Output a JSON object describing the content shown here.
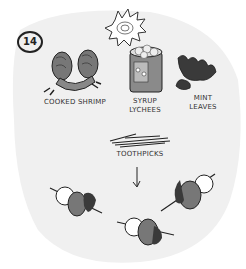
{
  "step_number": "14",
  "ingredients": [
    {
      "name": "Cooked Shrimp",
      "label": "COOKED SHRIMP"
    },
    {
      "name": "Syrup Lychees",
      "label_line1": "SYRUP",
      "label_line2": "LYCHEES"
    },
    {
      "name": "Mint Leaves",
      "label_line1": "MINT",
      "label_line2": "LEAVES"
    }
  ],
  "tool": {
    "label": "TOOTHPICKS"
  },
  "result": {
    "skewer_count": 3,
    "arrow": "down-arrow"
  },
  "colors": {
    "background_blob": "#f0f0f0",
    "ink": "#222222",
    "shrimp": "#777777",
    "mint": "#3a3a3a",
    "can": "#8a8a8a"
  }
}
